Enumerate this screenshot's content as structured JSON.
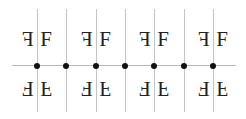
{
  "diagram": {
    "glyph": "F",
    "axis": {
      "y": 65,
      "x_start": 12,
      "x_end": 236,
      "color": "#b8b8b8"
    },
    "vertical_lines": {
      "x": [
        37,
        66,
        96,
        125,
        154,
        184,
        213
      ],
      "y_start": 9,
      "y_end": 112,
      "color": "#c4c4c4"
    },
    "dots": {
      "x": [
        37,
        66,
        96,
        125,
        154,
        184,
        213
      ],
      "y": 65,
      "color": "#111111"
    },
    "motif_centers": [
      37,
      96,
      154,
      213
    ],
    "top_row": {
      "left": "mirrored-F",
      "right": "F",
      "y": 29
    },
    "bottom_row": {
      "left": "rotated-F",
      "right": "vertically-flipped-F",
      "y": 78
    }
  }
}
